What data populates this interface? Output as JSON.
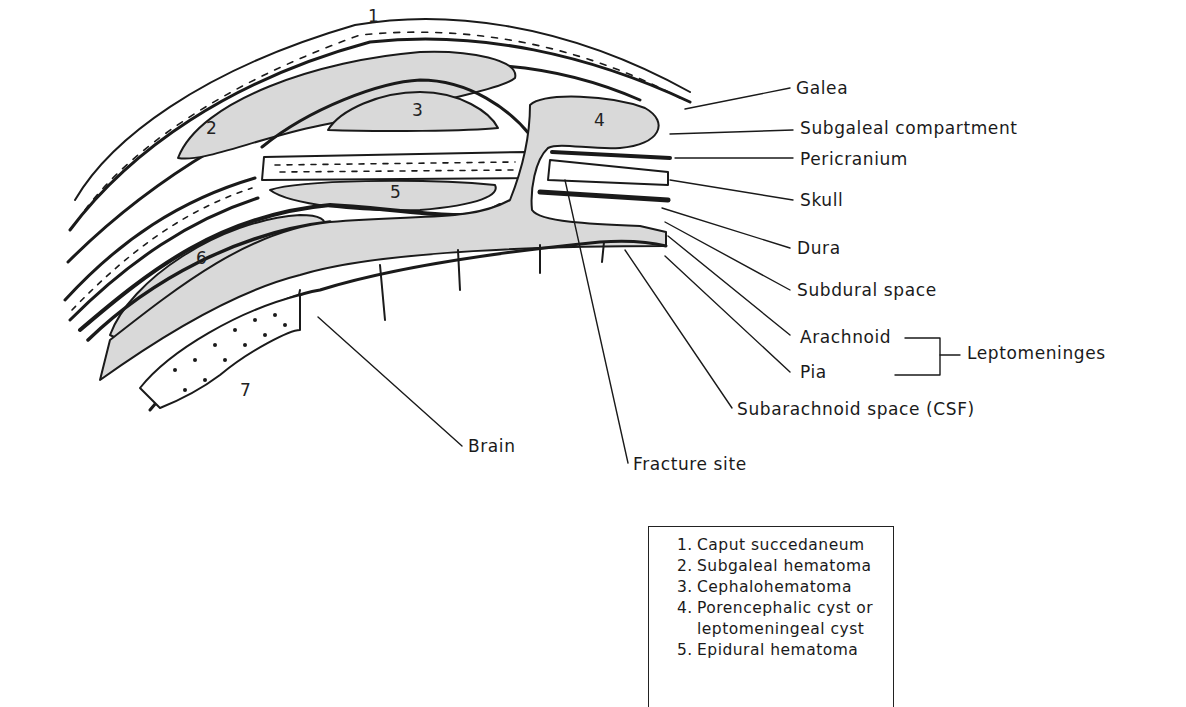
{
  "diagram": {
    "numbers": [
      "1",
      "2",
      "3",
      "4",
      "5",
      "6",
      "7"
    ],
    "labels": {
      "galea": "Galea",
      "subgaleal": "Subgaleal compartment",
      "pericranium": "Pericranium",
      "skull": "Skull",
      "dura": "Dura",
      "subdural": "Subdural space",
      "arachnoid": "Arachnoid",
      "pia": "Pia",
      "leptomeninges": "Leptomeninges",
      "subarachnoid": "Subarachnoid space (CSF)",
      "brain": "Brain",
      "fracture": "Fracture site"
    },
    "colors": {
      "ink": "#1a1a1a",
      "fill": "#d9d9d9",
      "background": "#ffffff"
    }
  },
  "legend": {
    "items": [
      {
        "num": "1.",
        "text": "Caput succedaneum"
      },
      {
        "num": "2.",
        "text": "Subgaleal hematoma"
      },
      {
        "num": "3.",
        "text": "Cephalohematoma"
      },
      {
        "num": "4.",
        "text": "Porencephalic cyst or"
      },
      {
        "num": "",
        "text": "leptomeningeal cyst"
      },
      {
        "num": "5.",
        "text": "Epidural hematoma"
      }
    ]
  }
}
